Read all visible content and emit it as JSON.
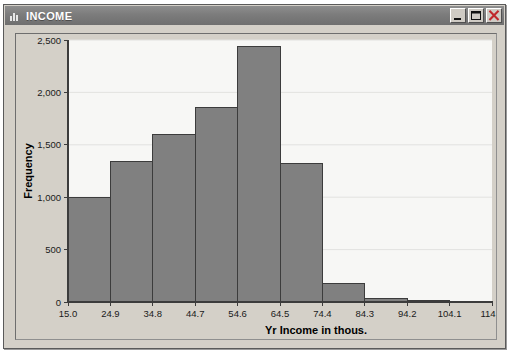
{
  "window": {
    "title": "INCOME",
    "icon": "bar-chart-icon",
    "controls": [
      {
        "name": "minimize-button",
        "glyph": "minimize-icon",
        "label": "Minimize"
      },
      {
        "name": "maximize-button",
        "glyph": "maximize-icon",
        "label": "Maximize"
      },
      {
        "name": "close-button",
        "glyph": "close-icon",
        "label": "Close"
      }
    ],
    "colors": {
      "titlebar": "#7c7c7c",
      "window_face": "#d4d0c8",
      "close_glyph": "#c0282c"
    }
  },
  "chart_data": {
    "type": "bar",
    "title": "",
    "subtitle": "",
    "xlabel": "Yr Income in thous.",
    "ylabel": "Frequency",
    "xlim": [
      15.0,
      114.0
    ],
    "ylim": [
      0,
      2500
    ],
    "grid": true,
    "legend": null,
    "bin_width": 9.9,
    "bar_color": "#808080",
    "bar_edge_color": "#3c3c3c",
    "plot_bg": "#f7f7f5",
    "xticks": [
      15.0,
      24.9,
      34.8,
      44.7,
      54.6,
      64.5,
      74.4,
      84.3,
      94.2,
      104.1,
      114.0
    ],
    "xticklabels": [
      "15.0",
      "24.9",
      "34.8",
      "44.7",
      "54.6",
      "64.5",
      "74.4",
      "84.3",
      "94.2",
      "104.1",
      "114.0"
    ],
    "yticks": [
      0,
      500,
      1000,
      1500,
      2000,
      2500
    ],
    "yticklabels": [
      "0",
      "500",
      "1,000",
      "1,500",
      "2,000",
      "2,500"
    ],
    "categories": [
      "15.0-24.9",
      "24.9-34.8",
      "34.8-44.7",
      "44.7-54.6",
      "54.6-64.5",
      "64.5-74.4",
      "74.4-84.3",
      "84.3-94.2",
      "94.2-104.1",
      "104.1-114.0"
    ],
    "bin_edges": [
      15.0,
      24.9,
      34.8,
      44.7,
      54.6,
      64.5,
      74.4,
      84.3,
      94.2,
      104.1,
      114.0
    ],
    "values": [
      1000,
      1340,
      1600,
      1860,
      2440,
      1320,
      180,
      30,
      10,
      5
    ]
  }
}
